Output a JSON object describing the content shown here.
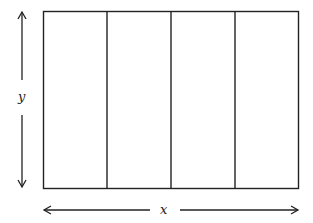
{
  "diagram": {
    "type": "rectangle-divided-into-vertical-strips",
    "strip_count": 4,
    "labels": {
      "vertical_dimension": "y",
      "horizontal_dimension": "x"
    },
    "colors": {
      "stroke": "#222222",
      "background": "#ffffff"
    }
  }
}
